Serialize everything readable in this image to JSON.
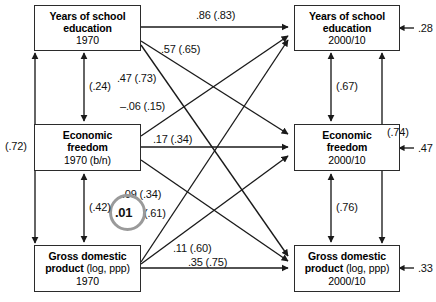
{
  "figure": {
    "type": "path-diagram"
  },
  "nodes": [
    {
      "id": "edu1970",
      "line1": "Years of school",
      "line2": "education",
      "line3": "1970",
      "side": "left"
    },
    {
      "id": "free1970",
      "line1": "Economic",
      "line2": "freedom",
      "line3": "1970 (b/n)",
      "side": "left"
    },
    {
      "id": "gdp1970",
      "line1": "Gross domestic",
      "line2": "product",
      "line2b": "(log, ppp)",
      "line3": "1970",
      "side": "left"
    },
    {
      "id": "edu2000",
      "line1": "Years of school",
      "line2": "education",
      "line3": "2000/10",
      "side": "right"
    },
    {
      "id": "free2000",
      "line1": "Economic",
      "line2": "freedom",
      "line3": "2000/10",
      "side": "right"
    },
    {
      "id": "gdp2000",
      "line1": "Gross domestic",
      "line2": "product",
      "line2b": "(log, ppp)",
      "line3": "2000/10",
      "side": "right"
    }
  ],
  "paths": [
    {
      "id": "edu-edu",
      "label": ".86 (.83)",
      "from": "edu1970",
      "to": "edu2000"
    },
    {
      "id": "edu-free",
      "label": ".57 (.65)",
      "from": "edu1970",
      "to": "free2000"
    },
    {
      "id": "edu-gdp",
      "label": ".47 (.73)",
      "from": "edu1970",
      "to": "gdp2000"
    },
    {
      "id": "free-edu",
      "label": "–.06 (.15)",
      "from": "free1970",
      "to": "edu2000"
    },
    {
      "id": "free-free",
      "label": ".17 (.34)",
      "from": "free1970",
      "to": "free2000"
    },
    {
      "id": "free-gdp",
      "label": ".09 (.34)",
      "from": "free1970",
      "to": "gdp2000"
    },
    {
      "id": "gdp-edu",
      "label": "(.61)",
      "from": "gdp1970",
      "to": "edu2000"
    },
    {
      "id": "gdp-free",
      "label": ".11 (.60)",
      "from": "gdp1970",
      "to": "free2000"
    },
    {
      "id": "gdp-gdp",
      "label": ".35 (.75)",
      "from": "gdp1970",
      "to": "gdp2000"
    }
  ],
  "highlight": {
    "value": ".01",
    "of_path": "gdp-edu",
    "ring_color": "#9a9a9a"
  },
  "covariances": [
    {
      "id": "cov-left-outer",
      "label": "(.72)",
      "between": [
        "edu1970",
        "gdp1970"
      ]
    },
    {
      "id": "cov-left-top",
      "label": "(.24)",
      "between": [
        "edu1970",
        "free1970"
      ]
    },
    {
      "id": "cov-left-bottom",
      "label": "(.42)",
      "between": [
        "free1970",
        "gdp1970"
      ]
    },
    {
      "id": "cov-right-top",
      "label": "(.67)",
      "between": [
        "edu2000",
        "free2000"
      ]
    },
    {
      "id": "cov-right-bottom",
      "label": "(.76)",
      "between": [
        "free2000",
        "gdp2000"
      ]
    },
    {
      "id": "cov-right-outer",
      "label": "(.74)",
      "between": [
        "edu2000",
        "gdp2000"
      ]
    }
  ],
  "residuals": [
    {
      "id": "res-edu2000",
      "label": ".28",
      "target": "edu2000"
    },
    {
      "id": "res-free2000",
      "label": ".47",
      "target": "free2000"
    },
    {
      "id": "res-gdp2000",
      "label": ".33",
      "target": "gdp2000"
    }
  ],
  "footnote": {
    "text": ""
  }
}
